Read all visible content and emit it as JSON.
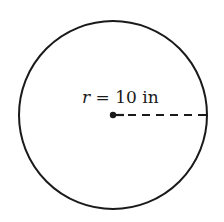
{
  "diagram": {
    "type": "circle-with-radius",
    "circle": {
      "cx": 113,
      "cy": 115,
      "r": 94,
      "stroke": "#1a1a1a",
      "stroke_width": 2
    },
    "radius_line": {
      "x1": 113,
      "y1": 115,
      "x2": 207,
      "y2": 115,
      "style": "dashed"
    },
    "center_dot": {
      "cx": 113,
      "cy": 115,
      "r": 3
    },
    "label": {
      "variable": "r",
      "equals": " = ",
      "value": "10",
      "unit": " in",
      "full": "r = 10 in"
    }
  }
}
